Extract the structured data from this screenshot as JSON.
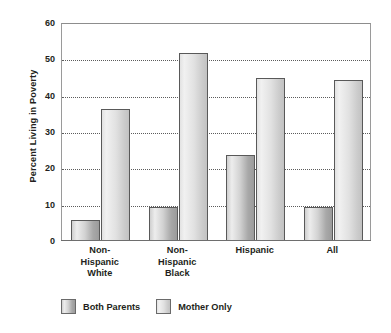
{
  "chart_data": {
    "type": "bar",
    "title": "",
    "subtitle": "",
    "xlabel": "",
    "ylabel": "Percent Living in Poverty",
    "ylim": [
      0,
      60
    ],
    "yticks": [
      0,
      10,
      20,
      30,
      40,
      50,
      60
    ],
    "ytick_labels": [
      "0",
      "10",
      "20",
      "30",
      "40",
      "50",
      "60"
    ],
    "grid": "horizontal-dotted",
    "legend_position": "bottom-left",
    "categories": [
      "Non-Hispanic White",
      "Non-Hispanic Black",
      "Hispanic",
      "All"
    ],
    "category_label_lines": [
      [
        "Non-",
        "Hispanic",
        "White"
      ],
      [
        "Non-",
        "Hispanic",
        "Black"
      ],
      [
        "Hispanic"
      ],
      [
        "All"
      ]
    ],
    "series": [
      {
        "name": "Both Parents",
        "color": "#b9b9b9",
        "values": [
          5.5,
          9,
          23.5,
          9
        ]
      },
      {
        "name": "Mother Only",
        "color": "#dedede",
        "values": [
          36,
          51.5,
          44.5,
          44
        ]
      }
    ],
    "annotations": []
  },
  "legend": {
    "items": [
      {
        "label": "Both Parents",
        "swatch": "both"
      },
      {
        "label": "Mother Only",
        "swatch": "mother"
      }
    ]
  },
  "colors": {
    "axis": "#9a9a9a",
    "gridline": "#5c5c5c",
    "text": "#231f20",
    "background": "#ffffff",
    "bar_border": "#595959"
  }
}
